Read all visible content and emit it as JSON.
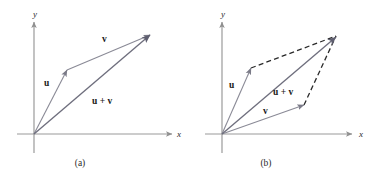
{
  "figure": {
    "background_color": "#ffffff",
    "vector_color": "#8a8a96",
    "resultant_color": "#6e6e7d",
    "dashed_color": "#2a2a2a",
    "axis_color": "#9a9a9a",
    "text_color": "#1a1a1a"
  },
  "panels": [
    {
      "id": "panel-a",
      "caption": "(a)",
      "caption_pos": {
        "x": 80,
        "y": 166
      },
      "origin": {
        "x": 34,
        "y": 134
      },
      "axes": {
        "x_label": "x",
        "y_label": "y",
        "x_label_pos": {
          "x": 177,
          "y": 137
        },
        "y_label_pos": {
          "x": 33,
          "y": 17
        },
        "x_axis": {
          "x1": 17,
          "y1": 134,
          "x2": 172,
          "y2": 134
        },
        "y_axis": {
          "x1": 34,
          "y1": 153,
          "x2": 34,
          "y2": 22
        }
      },
      "vectors": [
        {
          "name": "u",
          "label": "u",
          "label_pos": {
            "x": 44,
            "y": 86
          },
          "from": {
            "x": 34,
            "y": 134
          },
          "to": {
            "x": 67,
            "y": 70
          },
          "style": "solid"
        },
        {
          "name": "v",
          "label": "v",
          "label_pos": {
            "x": 102,
            "y": 42
          },
          "from": {
            "x": 67,
            "y": 70
          },
          "to": {
            "x": 150,
            "y": 35
          },
          "style": "solid"
        },
        {
          "name": "u_plus_v",
          "label": "u + v",
          "label_pos": {
            "x": 92,
            "y": 104
          },
          "from": {
            "x": 34,
            "y": 134
          },
          "to": {
            "x": 150,
            "y": 35
          },
          "style": "solid"
        }
      ],
      "dashed_edges": []
    },
    {
      "id": "panel-b",
      "caption": "(b)",
      "caption_pos": {
        "x": 266,
        "y": 166
      },
      "origin": {
        "x": 222,
        "y": 134
      },
      "axes": {
        "x_label": "x",
        "y_label": "y",
        "x_label_pos": {
          "x": 359,
          "y": 137
        },
        "y_label_pos": {
          "x": 221,
          "y": 17
        },
        "x_axis": {
          "x1": 205,
          "y1": 134,
          "x2": 352,
          "y2": 134
        },
        "y_axis": {
          "x1": 222,
          "y1": 153,
          "x2": 222,
          "y2": 22
        }
      },
      "vectors": [
        {
          "name": "u",
          "label": "u",
          "label_pos": {
            "x": 229,
            "y": 88
          },
          "from": {
            "x": 222,
            "y": 134
          },
          "to": {
            "x": 251,
            "y": 68
          },
          "style": "solid"
        },
        {
          "name": "v",
          "label": "v",
          "label_pos": {
            "x": 263,
            "y": 114
          },
          "from": {
            "x": 222,
            "y": 134
          },
          "to": {
            "x": 304,
            "y": 105
          },
          "style": "solid"
        },
        {
          "name": "u_plus_v",
          "label": "u + v",
          "label_pos": {
            "x": 273,
            "y": 95
          },
          "from": {
            "x": 222,
            "y": 134
          },
          "to": {
            "x": 336,
            "y": 37
          },
          "style": "solid"
        }
      ],
      "dashed_edges": [
        {
          "name": "u-to-sum",
          "from": {
            "x": 251,
            "y": 68
          },
          "to": {
            "x": 336,
            "y": 36
          }
        },
        {
          "name": "v-to-sum",
          "from": {
            "x": 304,
            "y": 105
          },
          "to": {
            "x": 336,
            "y": 36
          }
        }
      ]
    }
  ]
}
